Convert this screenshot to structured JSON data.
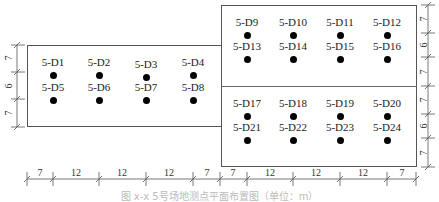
{
  "diagram": {
    "type": "borehole/measurement point layout plan",
    "left_box": {
      "points": [
        {
          "id": "5-D1",
          "x": 53,
          "y": 57
        },
        {
          "id": "5-D2",
          "x": 99,
          "y": 57
        },
        {
          "id": "5-D3",
          "x": 146,
          "y": 59
        },
        {
          "id": "5-D4",
          "x": 193,
          "y": 57
        },
        {
          "id": "5-D5",
          "x": 53,
          "y": 82
        },
        {
          "id": "5-D6",
          "x": 99,
          "y": 82
        },
        {
          "id": "5-D7",
          "x": 146,
          "y": 82
        },
        {
          "id": "5-D8",
          "x": 193,
          "y": 82
        }
      ]
    },
    "right_box": {
      "points": [
        {
          "id": "5-D9",
          "x": 247,
          "y": 17
        },
        {
          "id": "5-D10",
          "x": 293,
          "y": 17
        },
        {
          "id": "5-D11",
          "x": 340,
          "y": 17
        },
        {
          "id": "5-D12",
          "x": 387,
          "y": 17
        },
        {
          "id": "5-D13",
          "x": 247,
          "y": 41
        },
        {
          "id": "5-D14",
          "x": 293,
          "y": 41
        },
        {
          "id": "5-D15",
          "x": 340,
          "y": 41
        },
        {
          "id": "5-D16",
          "x": 387,
          "y": 41
        },
        {
          "id": "5-D17",
          "x": 247,
          "y": 98
        },
        {
          "id": "5-D18",
          "x": 293,
          "y": 98
        },
        {
          "id": "5-D19",
          "x": 340,
          "y": 98
        },
        {
          "id": "5-D20",
          "x": 387,
          "y": 98
        },
        {
          "id": "5-D21",
          "x": 247,
          "y": 122
        },
        {
          "id": "5-D22",
          "x": 293,
          "y": 122
        },
        {
          "id": "5-D23",
          "x": 340,
          "y": 122
        },
        {
          "id": "5-D24",
          "x": 387,
          "y": 122
        }
      ]
    },
    "horizontal_dimensions": [
      "7",
      "12",
      "12",
      "12",
      "7",
      "7",
      "12",
      "12",
      "12",
      "7"
    ],
    "left_vertical_dimensions": [
      "7",
      "6",
      "7"
    ],
    "right_vertical_dimensions": [
      "7",
      "6",
      "7",
      "7",
      "6",
      "7"
    ],
    "caption": "图 x-x  5号场地测点平面布置图（单位：m）"
  }
}
